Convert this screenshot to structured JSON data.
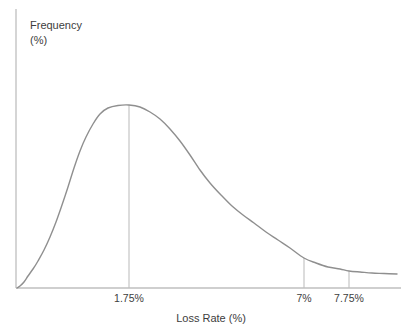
{
  "figure": {
    "background": "#ffffff",
    "text_color": "#3d3d3d",
    "axis_color": "#bfbfbf",
    "curve_color": "#8f8f8f",
    "dropline_color": "#bfbfbf",
    "ylabel_line1": "Frequency",
    "ylabel_line2": "(%)",
    "xlabel": "Loss Rate (%)"
  },
  "chart_data": {
    "type": "line",
    "title": "",
    "xlabel": "Loss Rate (%)",
    "ylabel": "Frequency (%)",
    "grid": false,
    "legend": false,
    "shape": "right-skewed frequency distribution curve, mode at 1.75%, long right tail past 7.75%",
    "x_tick_labels": [
      "1.75%",
      "7%",
      "7.75%"
    ],
    "axes_px": {
      "y_axis_x": 16,
      "y_axis_top": 9,
      "x_axis_y": 288,
      "x_axis_right": 401
    },
    "curve_points_px": [
      [
        17,
        288
      ],
      [
        20,
        286
      ],
      [
        24,
        282
      ],
      [
        28,
        276
      ],
      [
        33,
        269
      ],
      [
        38,
        261
      ],
      [
        44,
        250
      ],
      [
        50,
        237
      ],
      [
        56,
        222
      ],
      [
        62,
        205
      ],
      [
        68,
        187
      ],
      [
        74,
        168
      ],
      [
        80,
        151
      ],
      [
        86,
        137
      ],
      [
        93,
        124
      ],
      [
        100,
        114
      ],
      [
        108,
        108
      ],
      [
        118,
        105.5
      ],
      [
        129,
        105
      ],
      [
        140,
        107
      ],
      [
        150,
        112
      ],
      [
        160,
        119
      ],
      [
        170,
        129
      ],
      [
        180,
        141
      ],
      [
        190,
        155
      ],
      [
        200,
        170
      ],
      [
        210,
        183
      ],
      [
        221,
        195
      ],
      [
        232,
        206
      ],
      [
        243,
        215
      ],
      [
        254,
        223
      ],
      [
        266,
        232
      ],
      [
        278,
        240
      ],
      [
        290,
        248
      ],
      [
        304,
        258
      ],
      [
        316,
        263
      ],
      [
        328,
        267
      ],
      [
        340,
        269
      ],
      [
        349,
        271
      ],
      [
        360,
        272
      ],
      [
        372,
        273
      ],
      [
        384,
        273.5
      ],
      [
        397,
        274
      ]
    ],
    "droplines_px": [
      {
        "label": "1.75%",
        "x": 129,
        "y_top": 105,
        "y_bottom": 288
      },
      {
        "label": "7%",
        "x": 304,
        "y_top": 258,
        "y_bottom": 288
      },
      {
        "label": "7.75%",
        "x": 349,
        "y_top": 271,
        "y_bottom": 288
      }
    ]
  }
}
